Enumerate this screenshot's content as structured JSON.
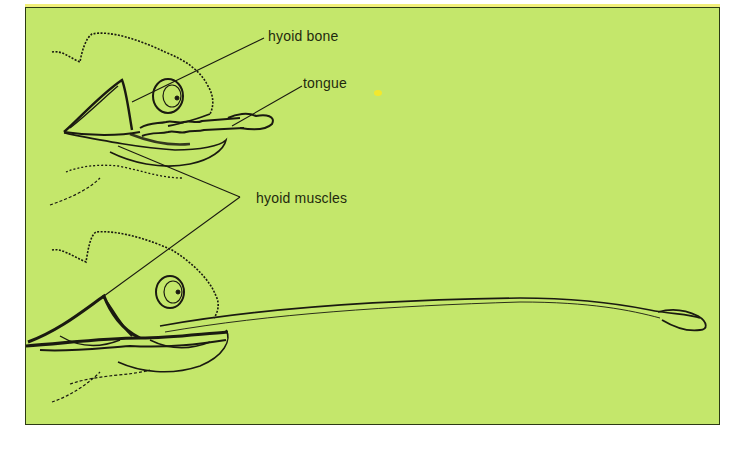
{
  "diagram": {
    "background_color": "#c4e76b",
    "border_color": "#2c3a14",
    "ink_color": "#1a1a10",
    "labels": {
      "hyoid_bone": "hyoid bone",
      "tongue": "tongue",
      "hyoid_muscles": "hyoid muscles"
    },
    "figures": [
      {
        "name": "tongue-retracted",
        "position": "top"
      },
      {
        "name": "tongue-extended",
        "position": "bottom"
      }
    ]
  }
}
